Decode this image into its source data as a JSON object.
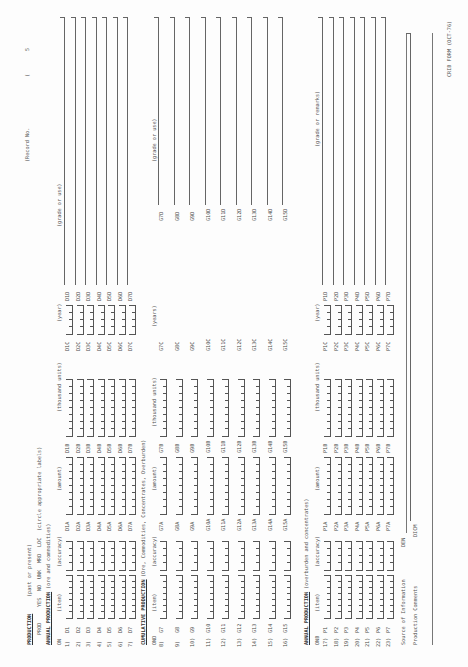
{
  "header": {
    "record_no_label": "(Record No.",
    "page_marks": [
      "(",
      "5"
    ],
    "form_footer": "CRIB FORM (OCT-76)"
  },
  "production": {
    "title": "PRODUCTION",
    "subtitle": "(past or present)",
    "status_options": [
      "PROD",
      "YES",
      "NO",
      "UNK",
      "MRD",
      "LOC"
    ],
    "status_note": "(circle appropriate labels)"
  },
  "annual_production": {
    "title": "ANNUAL PRODUCTION",
    "subtitle": "(ore and commodities)",
    "columns": {
      "on": "ON",
      "item": "(item)",
      "accuracy": "(accuracy)",
      "amount": "(amount)",
      "thousand_units": "(thousand units)",
      "year": "(year)",
      "grade_or_use": "(grade or use)"
    },
    "rows": [
      {
        "num": "1)",
        "code": "D1",
        "amount_code": "D1A",
        "units_code": "D1B",
        "year_code": "D1C",
        "grade_code": "D1D"
      },
      {
        "num": "2)",
        "code": "D2",
        "amount_code": "D2A",
        "units_code": "D2B",
        "year_code": "D2C",
        "grade_code": "D2D"
      },
      {
        "num": "3)",
        "code": "D3",
        "amount_code": "D3A",
        "units_code": "D3B",
        "year_code": "D3C",
        "grade_code": "D3D"
      },
      {
        "num": "4)",
        "code": "D4",
        "amount_code": "D4A",
        "units_code": "D4B",
        "year_code": "D4C",
        "grade_code": "D4D"
      },
      {
        "num": "5)",
        "code": "D5",
        "amount_code": "D5A",
        "units_code": "D5B",
        "year_code": "D5C",
        "grade_code": "D5D"
      },
      {
        "num": "6)",
        "code": "D6",
        "amount_code": "D6A",
        "units_code": "D6B",
        "year_code": "D6C",
        "grade_code": "D6D"
      },
      {
        "num": "7)",
        "code": "D7",
        "amount_code": "D7A",
        "units_code": "D7B",
        "year_code": "D7C",
        "grade_code": "D7D"
      }
    ]
  },
  "cumulative_production": {
    "title": "CUMULATIVE PRODUCTION",
    "subtitle": "(Ore, Commodities, Concentrates, Overburden)",
    "columns": {
      "ond": "OND",
      "item": "(item)",
      "accuracy": "(accuracy)",
      "amount": "(amount)",
      "thousand_units": "(thousand units)",
      "years": "(years)",
      "grade_or_use": "(grade or use)"
    },
    "rows": [
      {
        "num": "8)",
        "code": "G7",
        "amount_code": "G7A",
        "units_code": "G7B",
        "year_code": "G7C",
        "grade_code": "G7D"
      },
      {
        "num": "9)",
        "code": "G8",
        "amount_code": "G8A",
        "units_code": "G8B",
        "year_code": "G8C",
        "grade_code": "G8D"
      },
      {
        "num": "10)",
        "code": "G9",
        "amount_code": "G9A",
        "units_code": "G9B",
        "year_code": "G9C",
        "grade_code": "G9D"
      },
      {
        "num": "11)",
        "code": "G10",
        "amount_code": "G10A",
        "units_code": "G10B",
        "year_code": "G10C",
        "grade_code": "G10D"
      },
      {
        "num": "12)",
        "code": "G11",
        "amount_code": "G11A",
        "units_code": "G11B",
        "year_code": "G11C",
        "grade_code": "G11D"
      },
      {
        "num": "13)",
        "code": "G12",
        "amount_code": "G12A",
        "units_code": "G12B",
        "year_code": "G12C",
        "grade_code": "G12D"
      },
      {
        "num": "14)",
        "code": "G13",
        "amount_code": "G13A",
        "units_code": "G13B",
        "year_code": "G13C",
        "grade_code": "G13D"
      },
      {
        "num": "15)",
        "code": "G14",
        "amount_code": "G14A",
        "units_code": "G14B",
        "year_code": "G14C",
        "grade_code": "G14D"
      },
      {
        "num": "16)",
        "code": "G15",
        "amount_code": "G15A",
        "units_code": "G15B",
        "year_code": "G15C",
        "grade_code": "G15D"
      }
    ]
  },
  "annual_production_2": {
    "title": "ANNUAL PRODUCTION",
    "subtitle": "(overburden and concentrates)",
    "columns": {
      "onb": "ONB",
      "item": "(item)",
      "accuracy": "(accuracy)",
      "amount": "(amount)",
      "thousand_units": "(thousand units)",
      "year": "(year)",
      "grade_or_remarks": "(grade or remarks)"
    },
    "rows": [
      {
        "num": "17)",
        "code": "P1",
        "amount_code": "P1A",
        "units_code": "P1B",
        "year_code": "P1C",
        "grade_code": "P1D"
      },
      {
        "num": "18)",
        "code": "P2",
        "amount_code": "P2A",
        "units_code": "P2B",
        "year_code": "P2C",
        "grade_code": "P2D"
      },
      {
        "num": "19)",
        "code": "P3",
        "amount_code": "P3A",
        "units_code": "P3B",
        "year_code": "P3C",
        "grade_code": "P3D"
      },
      {
        "num": "20)",
        "code": "P4",
        "amount_code": "P4A",
        "units_code": "P4B",
        "year_code": "P4C",
        "grade_code": "P4D"
      },
      {
        "num": "21)",
        "code": "P5",
        "amount_code": "P5A",
        "units_code": "P5B",
        "year_code": "P5C",
        "grade_code": "P5D"
      },
      {
        "num": "22)",
        "code": "P6",
        "amount_code": "P6A",
        "units_code": "P6B",
        "year_code": "P6C",
        "grade_code": "P6D"
      },
      {
        "num": "23)",
        "code": "P7",
        "amount_code": "P7A",
        "units_code": "P7B",
        "year_code": "P7C",
        "grade_code": "P7D"
      }
    ],
    "source_label": "Source of Information",
    "source_code": "DEN",
    "comments_label": "Production Comments",
    "comments_code": "DICM"
  }
}
